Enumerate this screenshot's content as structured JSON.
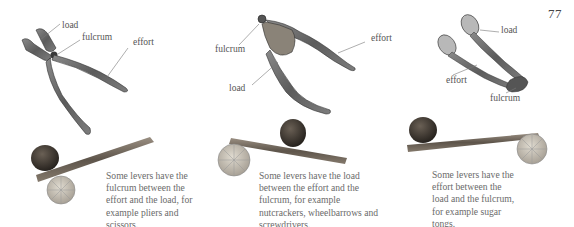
{
  "page_number": "77",
  "colors": {
    "text": "#6a6a6a",
    "label": "#555555",
    "metal": "#6b6b6b",
    "rock": "#3f3a35",
    "wood": "#7a6e62",
    "coin": "#c9c2b4"
  },
  "figures": [
    {
      "tool": "pliers",
      "lever_class": "first",
      "labels": {
        "load": "load",
        "fulcrum": "fulcrum",
        "effort": "effort"
      },
      "caption": "Some levers have the fulcrum between the effort and the load, for example pliers and scissors."
    },
    {
      "tool": "nutcracker",
      "lever_class": "second",
      "labels": {
        "fulcrum": "fulcrum",
        "load": "load",
        "effort": "effort"
      },
      "caption": "Some levers have the load between the effort and the fulcrum, for example nutcrackers, wheelbarrows and screwdrivers."
    },
    {
      "tool": "sugar-tongs",
      "lever_class": "third",
      "labels": {
        "load": "load",
        "effort": "effort",
        "fulcrum": "fulcrum"
      },
      "caption": "Some levers have the effort between the load and the fulcrum, for example sugar tongs."
    }
  ]
}
